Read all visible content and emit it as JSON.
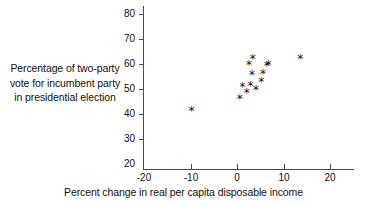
{
  "figure": {
    "name": "scatter-plot-incumbent-vote-vs-income",
    "background": "#ffffff",
    "marker_color": "#111111",
    "axis_color": "#4a4a4a",
    "marker_glyph": "*"
  },
  "labels": {
    "ylabel_line1": "Percentage of two-party",
    "ylabel_line2": "vote for incumbent party",
    "ylabel_line3": "in presidential election",
    "xlabel": "Percent change in real per capita disposable income"
  },
  "chart_data": {
    "type": "scatter",
    "title": "",
    "xlabel": "Percent change in real per capita disposable income",
    "ylabel": "Percentage of two-party vote for incumbent party in presidential election",
    "xlim": [
      -20,
      22
    ],
    "ylim": [
      20,
      83
    ],
    "xticks": [
      -20,
      -10,
      0,
      10,
      20
    ],
    "yticks": [
      20,
      30,
      40,
      50,
      60,
      70,
      80
    ],
    "xtick_labels": [
      "-20",
      "-10",
      "0",
      "10",
      "20"
    ],
    "ytick_labels": [
      "20",
      "30",
      "40",
      "50",
      "60",
      "70",
      "80"
    ],
    "grid": false,
    "legend": null,
    "marker": "*",
    "points": [
      {
        "x": -9.8,
        "y": 41.0
      },
      {
        "x": 0.6,
        "y": 46.0
      },
      {
        "x": 1.2,
        "y": 50.7
      },
      {
        "x": 2.1,
        "y": 48.3
      },
      {
        "x": 2.6,
        "y": 59.6
      },
      {
        "x": 2.9,
        "y": 51.1
      },
      {
        "x": 3.2,
        "y": 55.3
      },
      {
        "x": 3.4,
        "y": 62.0
      },
      {
        "x": 4.1,
        "y": 49.5
      },
      {
        "x": 5.2,
        "y": 52.5
      },
      {
        "x": 5.6,
        "y": 56.0
      },
      {
        "x": 6.4,
        "y": 59.0
      },
      {
        "x": 6.8,
        "y": 59.5
      },
      {
        "x": 13.6,
        "y": 62.0
      }
    ]
  }
}
